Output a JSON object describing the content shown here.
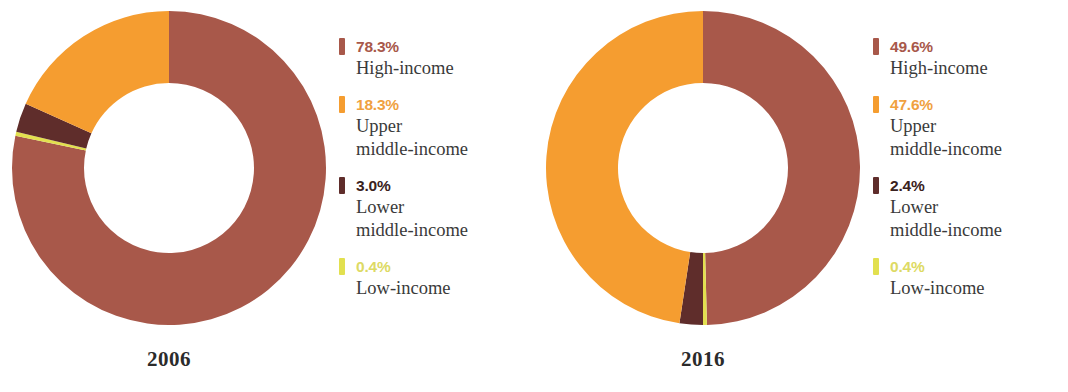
{
  "chart_data": [
    {
      "type": "pie",
      "title": "2006",
      "subtitle": "",
      "xlabel": "",
      "ylabel": "",
      "donut": true,
      "units": "percent",
      "legend_position": "right",
      "grid": false,
      "categories": [
        "High-income",
        "Upper middle-income",
        "Lower middle-income",
        "Low-income"
      ],
      "values": [
        78.3,
        18.3,
        3.0,
        0.4
      ],
      "labels": [
        "78.3%",
        "18.3%",
        "3.0%",
        "0.4%"
      ],
      "colors": [
        "#a8584a",
        "#f59d30",
        "#5f2d2b",
        "#e2e04f"
      ]
    },
    {
      "type": "pie",
      "title": "2016",
      "subtitle": "",
      "xlabel": "",
      "ylabel": "",
      "donut": true,
      "units": "percent",
      "legend_position": "right",
      "grid": false,
      "categories": [
        "High-income",
        "Upper middle-income",
        "Lower middle-income",
        "Low-income"
      ],
      "values": [
        49.6,
        47.6,
        2.4,
        0.4
      ],
      "labels": [
        "49.6%",
        "47.6%",
        "2.4%",
        "0.4%"
      ],
      "colors": [
        "#a8584a",
        "#f59d30",
        "#5f2d2b",
        "#e2e04f"
      ]
    }
  ],
  "palette": {
    "high_income": "#a8584a",
    "upper_middle_income": "#f59d30",
    "lower_middle_income": "#5f2d2b",
    "low_income": "#e2e04f",
    "text": "#3a3a3a",
    "background": "#ffffff"
  },
  "charts": [
    {
      "year_label": "2006",
      "legend": [
        {
          "pct": "78.3%",
          "name_lines": [
            "High-income"
          ],
          "color": "#a8584a",
          "pct_color": "#a8584a"
        },
        {
          "pct": "18.3%",
          "name_lines": [
            "Upper",
            "middle-income"
          ],
          "color": "#f59d30",
          "pct_color": "#f0a13f"
        },
        {
          "pct": "3.0%",
          "name_lines": [
            "Lower",
            "middle-income"
          ],
          "color": "#5f2d2b",
          "pct_color": "#3a2220"
        },
        {
          "pct": "0.4%",
          "name_lines": [
            "Low-income"
          ],
          "color": "#e2e04f",
          "pct_color": "#ddda63"
        }
      ]
    },
    {
      "year_label": "2016",
      "legend": [
        {
          "pct": "49.6%",
          "name_lines": [
            "High-income"
          ],
          "color": "#a8584a",
          "pct_color": "#a8584a"
        },
        {
          "pct": "47.6%",
          "name_lines": [
            "Upper",
            "middle-income"
          ],
          "color": "#f59d30",
          "pct_color": "#f0a13f"
        },
        {
          "pct": "2.4%",
          "name_lines": [
            "Lower",
            "middle-income"
          ],
          "color": "#5f2d2b",
          "pct_color": "#3a2220"
        },
        {
          "pct": "0.4%",
          "name_lines": [
            "Low-income"
          ],
          "color": "#e2e04f",
          "pct_color": "#ddda63"
        }
      ]
    }
  ]
}
